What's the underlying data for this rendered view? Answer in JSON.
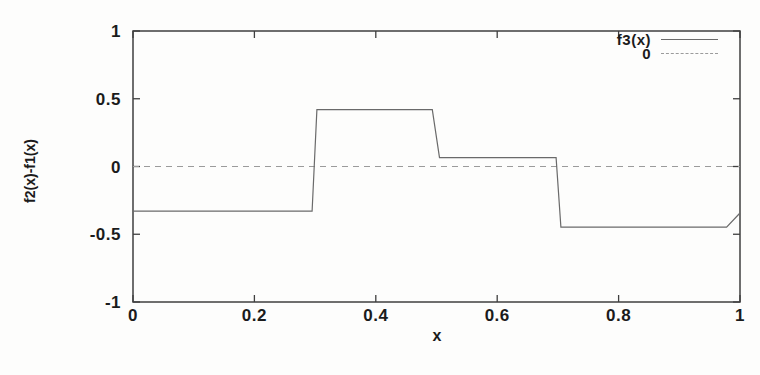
{
  "colors": {
    "background": "#fdfdfc",
    "frame": "#3f3f3f",
    "series_line": "#6a6a6a",
    "zero_line": "#9b9b9b",
    "text": "#1b1b1b"
  },
  "legend": {
    "entries": [
      {
        "label": "f3(x)",
        "style": "solid"
      },
      {
        "label": "0",
        "style": "dashed"
      }
    ]
  },
  "chart_data": {
    "type": "line",
    "title": "",
    "xlabel": "x",
    "ylabel": "f2(x)-f1(x)",
    "xlim": [
      0,
      1
    ],
    "ylim": [
      -1,
      1
    ],
    "grid": false,
    "legend_position": "top-right-inside",
    "x_ticks": {
      "values": [
        0,
        0.2,
        0.4,
        0.6,
        0.8,
        1
      ],
      "labels": [
        "0",
        "0.2",
        "0.4",
        "0.6",
        "0.8",
        "1"
      ]
    },
    "y_ticks": {
      "values": [
        -1,
        -0.5,
        0,
        0.5,
        1
      ],
      "labels": [
        "-1",
        "-0.5",
        "0",
        "0.5",
        "1"
      ]
    },
    "series": [
      {
        "name": "f3(x)",
        "style": "solid",
        "x": [
          0,
          0.295,
          0.303,
          0.493,
          0.505,
          0.697,
          0.705,
          0.978,
          1.0
        ],
        "y": [
          -0.33,
          -0.33,
          0.42,
          0.42,
          0.065,
          0.065,
          -0.447,
          -0.447,
          -0.343
        ]
      },
      {
        "name": "0",
        "style": "dashed",
        "x": [
          0,
          1
        ],
        "y": [
          0,
          0
        ]
      }
    ]
  }
}
